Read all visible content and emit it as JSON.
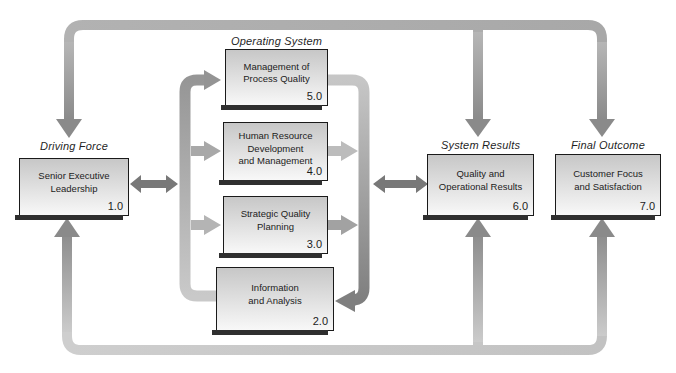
{
  "diagram": {
    "name": "Baldrige Award quality framework flow diagram",
    "labels": {
      "driving_force": "Driving Force",
      "operating_system": "Operating System",
      "system_results": "System Results",
      "final_outcome": "Final Outcome"
    },
    "boxes": [
      {
        "id": "senior-executive-leadership",
        "lines": [
          "Senior Executive",
          "Leadership"
        ],
        "number": "1.0"
      },
      {
        "id": "management-of-process-quality",
        "lines": [
          "Management of",
          "Process Quality"
        ],
        "number": "5.0"
      },
      {
        "id": "human-resource-development-and-management",
        "lines": [
          "Human Resource",
          "Development",
          "and Management"
        ],
        "number": "4.0"
      },
      {
        "id": "strategic-quality-planning",
        "lines": [
          "Strategic Quality",
          "Planning"
        ],
        "number": "3.0"
      },
      {
        "id": "information-and-analysis",
        "lines": [
          "Information",
          "and Analysis"
        ],
        "number": "2.0"
      },
      {
        "id": "quality-and-operational-results",
        "lines": [
          "Quality and",
          "Operational Results"
        ],
        "number": "6.0"
      },
      {
        "id": "customer-focus-and-satisfaction",
        "lines": [
          "Customer Focus",
          "and Satisfaction"
        ],
        "number": "7.0"
      }
    ],
    "colors": {
      "box_fill_top": "#c7c7c7",
      "box_fill_bottom": "#f8f8f8",
      "box_border": "#1a1a1a",
      "box_shadow": "#2f2f2f",
      "two_way_arrow": "#787878",
      "arrowhead_dark": "#8a8a8a",
      "top_bar": "#b0b0b0",
      "bottom_bar": "#c9c9c9",
      "text": "#1c1c1c"
    }
  }
}
